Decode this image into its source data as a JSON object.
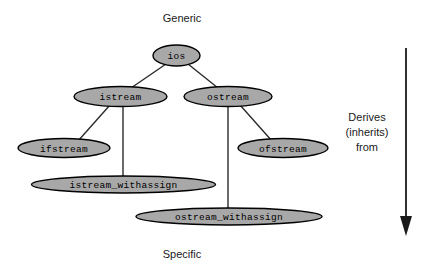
{
  "diagram": {
    "title_top": "Generic",
    "title_bottom": "Specific",
    "legend": {
      "line1": "Derives",
      "line2": "(inherits)",
      "line3": "from"
    },
    "colors": {
      "node_fill": "#a8a8a8",
      "node_stroke": "#000000",
      "edge": "#2b2b2b",
      "text": "#000000",
      "background": "#ffffff",
      "arrow": "#1a1a1a"
    },
    "nodes": [
      {
        "id": "ios",
        "label": "ios",
        "cx": 176.5,
        "cy": 55.5,
        "rx": 23.5,
        "ry": 10.5
      },
      {
        "id": "istream",
        "label": "istream",
        "cx": 120.5,
        "cy": 96.5,
        "rx": 46.5,
        "ry": 10.0
      },
      {
        "id": "ostream",
        "label": "ostream",
        "cx": 228.0,
        "cy": 96.5,
        "rx": 44.0,
        "ry": 10.0
      },
      {
        "id": "ifstream",
        "label": "ifstream",
        "cx": 64.0,
        "cy": 148.0,
        "rx": 46.0,
        "ry": 9.5
      },
      {
        "id": "ofstream",
        "label": "ofstream",
        "cx": 283.0,
        "cy": 148.0,
        "rx": 45.0,
        "ry": 9.5
      },
      {
        "id": "istream_withassign",
        "label": "istream_withassign",
        "cx": 123.5,
        "cy": 184.5,
        "rx": 92.0,
        "ry": 8.5
      },
      {
        "id": "ostream_withassign",
        "label": "ostream_withassign",
        "cx": 229.0,
        "cy": 216.5,
        "rx": 93.0,
        "ry": 8.5
      }
    ],
    "edges": [
      {
        "from": "ios",
        "to": "istream",
        "x1": 166,
        "y1": 64,
        "x2": 131,
        "y2": 88
      },
      {
        "from": "ios",
        "to": "ostream",
        "x1": 188,
        "y1": 64,
        "x2": 218,
        "y2": 88
      },
      {
        "from": "istream",
        "to": "ifstream",
        "x1": 110,
        "y1": 105,
        "x2": 78,
        "y2": 140
      },
      {
        "from": "istream",
        "to": "istream_withassign",
        "x1": 123,
        "y1": 106,
        "x2": 123,
        "y2": 177
      },
      {
        "from": "ostream",
        "to": "ofstream",
        "x1": 240,
        "y1": 105,
        "x2": 272,
        "y2": 140
      },
      {
        "from": "ostream",
        "to": "ostream_withassign",
        "x1": 228,
        "y1": 106,
        "x2": 228,
        "y2": 209
      }
    ],
    "arrow": {
      "name": "derives-direction-arrow",
      "x": 406,
      "y_top": 48,
      "y_bottom": 236,
      "head_half_width": 6,
      "head_height": 20
    },
    "labels": {
      "top": {
        "x": 182,
        "y": 19
      },
      "bottom": {
        "x": 182,
        "y": 255
      },
      "legend_x": 367,
      "legend_y1": 118,
      "legend_y2": 133,
      "legend_y3": 148
    }
  }
}
